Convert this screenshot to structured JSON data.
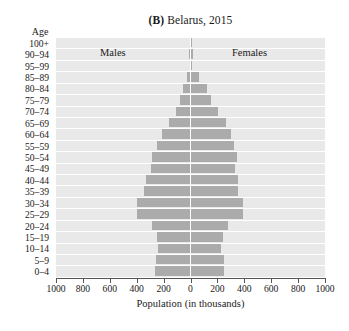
{
  "figure": {
    "panel_letter": "(B)",
    "title_text": "Belarus, 2015",
    "age_axis_header": "Age",
    "x_axis_title": "Population (in thousands)",
    "left_series_label": "Males",
    "right_series_label": "Females",
    "bar_color": "#ababab",
    "plot_background": "#e9e9e9",
    "gridline_color": "#ffffff"
  },
  "chart_data": {
    "type": "bar",
    "subtype": "population-pyramid",
    "title": "(B) Belarus, 2015",
    "xlabel": "Population (in thousands)",
    "ylabel": "Age",
    "xlim": [
      -1000,
      1000
    ],
    "xticks": [
      1000,
      800,
      600,
      400,
      200,
      0,
      200,
      400,
      600,
      800,
      1000
    ],
    "xtick_labels": [
      "1000",
      "800",
      "600",
      "400",
      "200",
      "0",
      "200",
      "400",
      "600",
      "800",
      "1000"
    ],
    "grid": true,
    "legend": [
      "Males",
      "Females"
    ],
    "legend_position": "in-plot-top",
    "units": "thousands",
    "categories": [
      "100+",
      "90–94",
      "95–99",
      "85–89",
      "80–84",
      "75–79",
      "70–74",
      "65–69",
      "60–64",
      "55–59",
      "50–54",
      "45–49",
      "40–44",
      "35–39",
      "30–34",
      "25–29",
      "20–24",
      "15–19",
      "10–14",
      "5–9",
      "0–4"
    ],
    "series": [
      {
        "name": "Males",
        "side": "left",
        "values": [
          2,
          8,
          3,
          25,
          55,
          75,
          110,
          160,
          210,
          250,
          285,
          295,
          330,
          345,
          395,
          400,
          290,
          250,
          240,
          260,
          265
        ]
      },
      {
        "name": "Females",
        "side": "right",
        "values": [
          4,
          22,
          7,
          60,
          120,
          150,
          205,
          265,
          300,
          325,
          345,
          330,
          350,
          355,
          390,
          390,
          280,
          240,
          230,
          250,
          250
        ]
      }
    ]
  }
}
